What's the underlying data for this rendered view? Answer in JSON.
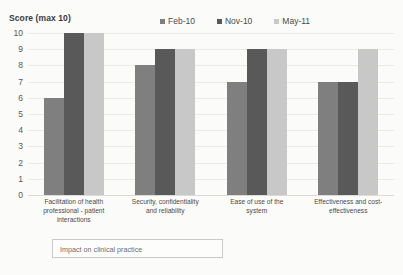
{
  "chart_data": {
    "type": "bar",
    "title": "",
    "ylabel": "Score (max 10)",
    "xlabel": "",
    "ylim": [
      0,
      10
    ],
    "yticks": [
      10,
      9,
      8,
      7,
      6,
      5,
      4,
      3,
      2,
      1,
      0
    ],
    "grid": true,
    "legend_position": "top-center",
    "categories": [
      "Facilitation of health professional - patient interactions",
      "Security, confidentiality and reliability",
      "Ease of use of the system",
      "Effectiveness and cost-effectiveness"
    ],
    "category_lines": [
      [
        "Facilitation of health",
        "professional - patient",
        "interactions"
      ],
      [
        "Security, confidentiality",
        "and reliability"
      ],
      [
        "Ease of use of the",
        "system"
      ],
      [
        "Effectiveness and cost-",
        "effectiveness"
      ]
    ],
    "series": [
      {
        "name": "Feb-10",
        "color": "#7f7f7f",
        "values": [
          6,
          8,
          7,
          7
        ]
      },
      {
        "name": "Nov-10",
        "color": "#595959",
        "values": [
          10,
          9,
          9,
          7
        ]
      },
      {
        "name": "May-11",
        "color": "#c8c8c8",
        "values": [
          10,
          9,
          9,
          9
        ]
      }
    ]
  },
  "footer": {
    "label": "Impact on clinical practice"
  }
}
